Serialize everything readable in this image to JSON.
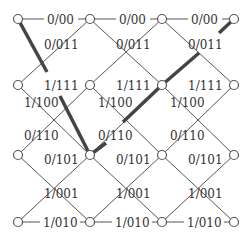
{
  "diagram": {
    "type": "trellis",
    "nodes_x": [
      18,
      90,
      162,
      234
    ],
    "nodes_y": [
      19,
      85,
      155,
      222
    ],
    "labels": {
      "row0_edge": "0/00",
      "row0_down": "0/011",
      "row1_straight": "1/111",
      "row1_down": "1/100",
      "row2_up": "0/110",
      "row2_straight": "0/101",
      "row3_up": "1/001",
      "row3_edge": "1/010"
    },
    "highlight_color": "#444444",
    "edge_color": "#555555"
  }
}
